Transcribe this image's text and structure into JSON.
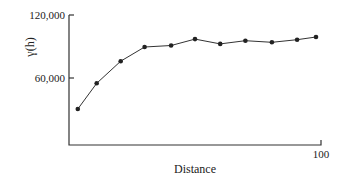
{
  "chart_data": {
    "type": "line",
    "title": "",
    "xlabel": "Distance",
    "ylabel": "γ(h)",
    "xlim": [
      0,
      100
    ],
    "ylim": [
      0,
      120000
    ],
    "x_ticks": [
      {
        "value": 100,
        "label": "100"
      }
    ],
    "y_ticks": [
      {
        "value": 60000,
        "label": "60,000"
      },
      {
        "value": 120000,
        "label": "120,000"
      }
    ],
    "grid": false,
    "legend": null,
    "series": [
      {
        "name": "semivariogram",
        "x": [
          3.5,
          11,
          20.5,
          30,
          40.5,
          50,
          60,
          70,
          80.5,
          90.5,
          98
        ],
        "values": [
          30500,
          55000,
          76000,
          89500,
          91000,
          97000,
          92500,
          95500,
          94000,
          96500,
          99000
        ]
      }
    ]
  }
}
